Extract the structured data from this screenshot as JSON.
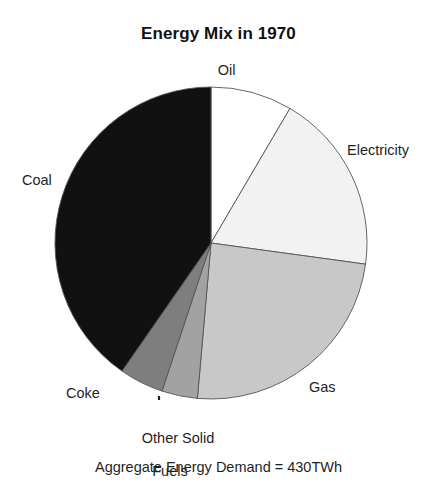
{
  "chart_data": {
    "type": "pie",
    "title": "Energy Mix in 1970",
    "caption": "Aggregate Energy Demand = 430TWh",
    "total_label": "Aggregate Energy Demand",
    "total_value": "430TWh",
    "categories": [
      "Oil",
      "Electricity",
      "Gas",
      "Other Solid Fuels",
      "Coke",
      "Coal"
    ],
    "values": [
      8.4,
      18.7,
      24.2,
      3.7,
      4.6,
      40.4
    ],
    "units": "percent",
    "angles_deg": [
      30.4,
      67.4,
      87.2,
      13.3,
      16.5,
      145.2
    ],
    "start_angle_deg": 0,
    "direction": "clockwise",
    "colors": [
      "#ffffff",
      "#f2f2f2",
      "#c8c8c8",
      "#a2a2a2",
      "#7e7e7e",
      "#111111"
    ],
    "stroke": "#555555",
    "legend": "none",
    "labels_position": "outside",
    "xlabel": "",
    "ylabel": ""
  },
  "labels": {
    "oil": "Oil",
    "electricity": "Electricity",
    "coal": "Coal",
    "gas": "Gas",
    "coke": "Coke",
    "other_solid_fuels_line1": "Other Solid",
    "other_solid_fuels_line2": "Fuels"
  }
}
